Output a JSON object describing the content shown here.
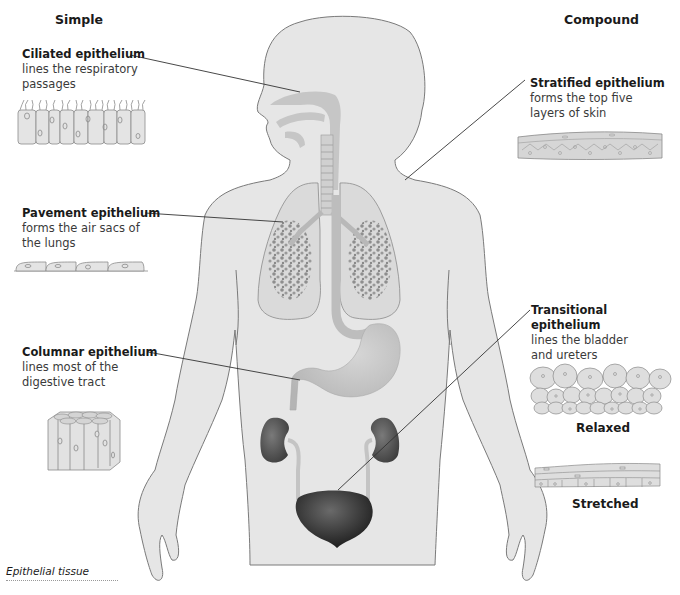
{
  "headings": {
    "simple": "Simple",
    "compound": "Compound"
  },
  "simple": [
    {
      "title": "Ciliated epithelium",
      "desc_lines": [
        "lines the respiratory",
        "passages"
      ],
      "target": "respiratory passages"
    },
    {
      "title": "Pavement epithelium",
      "desc_lines": [
        "forms the air sacs of",
        "the lungs"
      ],
      "target": "lungs"
    },
    {
      "title": "Columnar epithelium",
      "desc_lines": [
        "lines most of the",
        "digestive tract"
      ],
      "target": "stomach / digestive tract"
    }
  ],
  "compound": [
    {
      "title": "Stratified epithelium",
      "desc_lines": [
        "forms the top five",
        "layers of skin"
      ],
      "target": "skin"
    },
    {
      "title": "Transitional epithelium",
      "desc_lines": [
        "lines the bladder",
        "and ureters"
      ],
      "target": "bladder"
    }
  ],
  "transitional_states": {
    "relaxed": "Relaxed",
    "stretched": "Stretched"
  },
  "caption": "Epithelial tissue",
  "colors": {
    "body_fill": "#e6e6e6",
    "body_stroke": "#7a7a7a",
    "organ_fill": "#c8c8c8",
    "kidney_fill": "#5a5a5a",
    "bladder_fill": "#2e2e2e",
    "leader_line": "#333333"
  }
}
